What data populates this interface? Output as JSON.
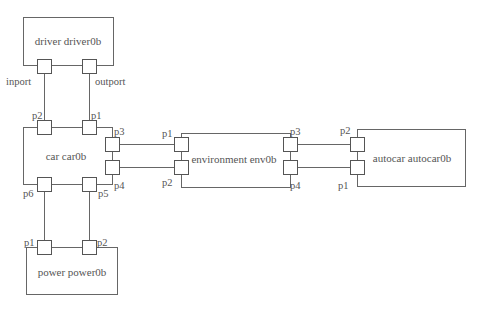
{
  "diagram": {
    "blocks": [
      {
        "id": "driver",
        "label": "driver driver0b",
        "ports": {
          "inport": "inport",
          "outport": "outport"
        }
      },
      {
        "id": "car",
        "label": "car car0b",
        "ports": {
          "p1": "p1",
          "p2": "p2",
          "p3": "p3",
          "p4": "p4",
          "p5": "p5",
          "p6": "p6"
        }
      },
      {
        "id": "power",
        "label": "power power0b",
        "ports": {
          "p1": "p1",
          "p2": "p2"
        }
      },
      {
        "id": "environment",
        "label": "environment env0b",
        "ports": {
          "p1": "p1",
          "p2": "p2",
          "p3": "p3",
          "p4": "p4"
        }
      },
      {
        "id": "autocar",
        "label": "autocar autocar0b",
        "ports": {
          "p1": "p1",
          "p2": "p2"
        }
      }
    ],
    "connections": [
      {
        "from": "driver.inport",
        "to": "car.p2"
      },
      {
        "from": "driver.outport",
        "to": "car.p1"
      },
      {
        "from": "car.p3",
        "to": "environment.p1"
      },
      {
        "from": "car.p4",
        "to": "environment.p2"
      },
      {
        "from": "environment.p3",
        "to": "autocar.p2"
      },
      {
        "from": "environment.p4",
        "to": "autocar.p1"
      },
      {
        "from": "car.p6",
        "to": "power.p1"
      },
      {
        "from": "car.p5",
        "to": "power.p2"
      }
    ]
  }
}
